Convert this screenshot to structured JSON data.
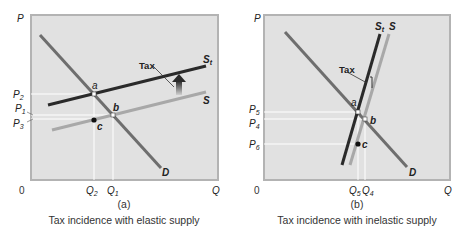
{
  "panels": [
    {
      "id": "a",
      "panel_label": "(a)",
      "caption": "Tax incidence with elastic supply",
      "axis": {
        "y_label": "P",
        "x_label": "Q",
        "origin": "0"
      },
      "price_labels": {
        "p_high": "P",
        "p_high_sub": "2",
        "p_mid": "P",
        "p_mid_sub": "1",
        "p_low": "P",
        "p_low_sub": "3"
      },
      "quantity_labels": {
        "q_a": "Q",
        "q_a_sub": "2",
        "q_b": "Q",
        "q_b_sub": "1"
      },
      "curves": {
        "demand": "D",
        "supply": "S",
        "supply_tax": "S",
        "supply_tax_sub": "t"
      },
      "points": {
        "a": "a",
        "b": "b",
        "c": "c"
      },
      "tax_label": "Tax"
    },
    {
      "id": "b",
      "panel_label": "(b)",
      "caption": "Tax incidence with inelastic supply",
      "axis": {
        "y_label": "P",
        "x_label": "Q",
        "origin": "0"
      },
      "price_labels": {
        "p_high": "P",
        "p_high_sub": "5",
        "p_mid": "P",
        "p_mid_sub": "4",
        "p_low": "P",
        "p_low_sub": "6"
      },
      "quantity_labels": {
        "q_a": "Q",
        "q_a_sub": "5",
        "q_b": "Q",
        "q_b_sub": "4"
      },
      "curves": {
        "demand": "D",
        "supply": "S",
        "supply_tax": "S",
        "supply_tax_sub": "t"
      },
      "points": {
        "a": "a",
        "b": "b",
        "c": "c"
      },
      "tax_label": "Tax"
    }
  ],
  "colors": {
    "plot_bg": "#e1e1e1",
    "plot_border": "#b3b3b3",
    "demand": "#6e6e6e",
    "supply": "#a8a8a8",
    "supply_tax": "#2a2a2a",
    "guide": "#ffffff"
  }
}
